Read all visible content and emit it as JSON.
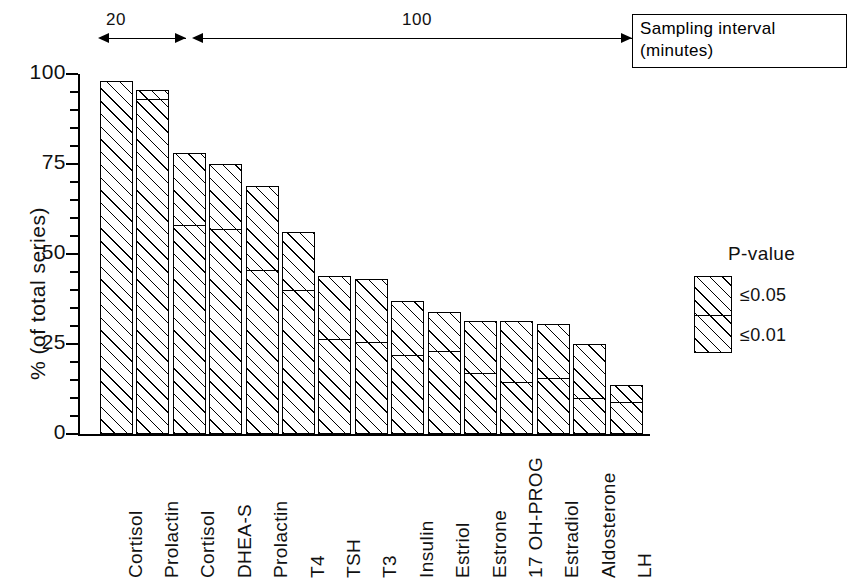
{
  "chart_data": {
    "type": "bar",
    "subtype": "stacked-bar",
    "title": "",
    "xlabel": "",
    "ylabel": "% (of total series)",
    "ylim": [
      0,
      100
    ],
    "ytick_labels": [
      "0",
      "25",
      "50",
      "75",
      "100"
    ],
    "ytick_values": [
      0,
      25,
      50,
      75,
      100
    ],
    "minor_tick_step": 5,
    "grid": false,
    "legend_position": "right",
    "categories": [
      "Cortisol",
      "Prolactin",
      "Cortisol",
      "DHEA-S",
      "Prolactin",
      "T4",
      "TSH",
      "T3",
      "Insulin",
      "Estriol",
      "Estrone",
      "17 OH-PROG",
      "Estradiol",
      "Aldosterone",
      "LH"
    ],
    "series": [
      {
        "name": "≤0.01",
        "label": "P ≤ 0.01",
        "values": [
          98,
          93,
          58,
          57,
          45.5,
          40,
          26.5,
          25.5,
          22,
          23,
          17,
          14.5,
          15.5,
          10,
          9
        ]
      },
      {
        "name": "≤0.05",
        "label": "P ≤ 0.05",
        "values": [
          0,
          2.5,
          20,
          18,
          23.5,
          16,
          17.5,
          17.5,
          15,
          11,
          14.5,
          17,
          15,
          15,
          4.5
        ]
      }
    ],
    "totals": [
      98,
      95.5,
      78,
      75,
      69,
      56,
      44,
      43,
      37,
      34,
      31.5,
      31.5,
      30.5,
      25,
      13.5
    ],
    "annotations": [
      {
        "text": "20",
        "span_categories": [
          "Cortisol",
          "Prolactin"
        ],
        "kind": "sampling-interval-arrow"
      },
      {
        "text": "100",
        "span_categories": [
          "Cortisol",
          "LH"
        ],
        "kind": "sampling-interval-arrow"
      }
    ],
    "callout": "Sampling interval\n(minutes)"
  },
  "annotations": {
    "group_20_label": "20",
    "group_100_label": "100",
    "callout_text": "Sampling interval\n(minutes)"
  },
  "axis": {
    "ylabel": "% (of total series)",
    "yticks": [
      "100",
      "75",
      "50",
      "25",
      "0"
    ]
  },
  "legend": {
    "title": "P-value",
    "upper_label": "≤0.05",
    "lower_label": "≤0.01"
  },
  "colors": {
    "ink": "#000000",
    "background": "#ffffff",
    "hatch": "#000000"
  }
}
